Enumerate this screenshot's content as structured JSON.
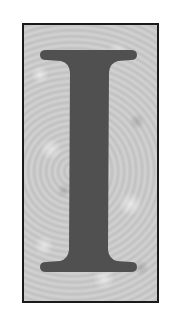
{
  "image": {
    "letter": "I",
    "description": "Decorative drop-cap letter I on mottled gray textured background inside a black frame",
    "colors": {
      "letter": "#505050",
      "background": "#c8c8c8",
      "border": "#1a1a1a",
      "page": "#ffffff"
    }
  }
}
